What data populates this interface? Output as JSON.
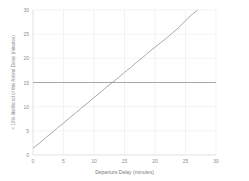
{
  "chart_data": {
    "type": "line",
    "title": "",
    "subtitle": "",
    "xlabel": "Departure Delay (minutes)",
    "ylabel": "< 10% likelihood of this Arrival Delay (minutes)",
    "xlim": [
      0,
      30
    ],
    "ylim": [
      0,
      30
    ],
    "xticks": [
      0,
      5,
      10,
      15,
      20,
      25,
      30
    ],
    "yticks": [
      0,
      5,
      10,
      15,
      20,
      25,
      30
    ],
    "xtick_labels": [
      "0",
      "5",
      "10",
      "15",
      "20",
      "25",
      "30"
    ],
    "ytick_labels": [
      "0",
      "5",
      "10",
      "15",
      "20",
      "25",
      "30"
    ],
    "grid": true,
    "legend": "none",
    "series": [
      {
        "name": "arrival-delay-threshold",
        "type": "line",
        "color": "#9a9a9a",
        "x": [
          0,
          1,
          2,
          3,
          4,
          5,
          6,
          7,
          8,
          9,
          10,
          11,
          12,
          13,
          14,
          15,
          16,
          17,
          18,
          19,
          20,
          21,
          22,
          23,
          24,
          25,
          26,
          27
        ],
        "values": [
          1.4,
          2.4,
          3.5,
          4.5,
          5.6,
          6.6,
          7.7,
          8.7,
          9.8,
          10.8,
          11.9,
          12.9,
          14.0,
          15.0,
          16.0,
          17.1,
          18.1,
          19.2,
          20.2,
          21.3,
          22.3,
          23.3,
          24.3,
          25.4,
          26.5,
          27.8,
          29.0,
          30.0
        ]
      },
      {
        "name": "reference-line-15-min",
        "type": "line",
        "color": "#9a9a9a",
        "x": [
          0,
          30
        ],
        "values": [
          15,
          15
        ]
      }
    ],
    "annotations": [],
    "intersection_x": 13.5,
    "intersection_y": 15
  },
  "colors": {
    "background": "#ffffff",
    "grid": "#ececec",
    "axis": "#e2e2e2",
    "line": "#9a9a9a",
    "tick_text": "#8d8d8d",
    "axis_title": "#7a7a7a"
  }
}
